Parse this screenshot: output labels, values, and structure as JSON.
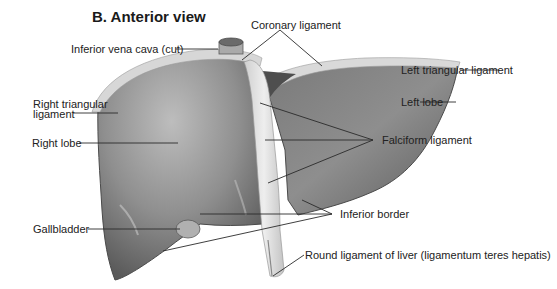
{
  "title": "B. Anterior view",
  "labels": {
    "coronary_ligament": "Coronary ligament",
    "inferior_vena_cava": "Inferior vena cava (cut)",
    "left_triangular_ligament": "Left triangular ligament",
    "right_triangular_ligament_line1": "Right triangular",
    "right_triangular_ligament_line2": "ligament",
    "left_lobe": "Left lobe",
    "right_lobe": "Right lobe",
    "falciform_ligament": "Falciform ligament",
    "inferior_border": "Inferior border",
    "gallbladder": "Gallbladder",
    "round_ligament": "Round ligament of liver (ligamentum teres hepatis)"
  },
  "colors": {
    "liver_dark": "#5e5e5e",
    "liver_mid": "#8a8a8a",
    "liver_light": "#b5b5b5",
    "ligament": "#d8d8d8",
    "leader_line": "#2a2a2a"
  }
}
